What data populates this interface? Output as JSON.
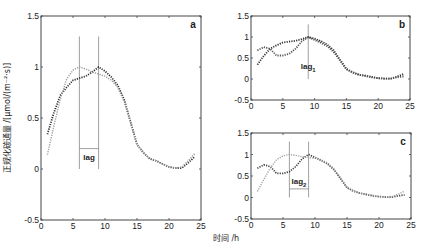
{
  "chart_data": [
    {
      "type": "line",
      "panel": "a",
      "title": "a",
      "xlabel": "时间 /h",
      "ylabel": "正规化碳通量 /[μmol/(m⁻²·s)]",
      "xlim": [
        0,
        25
      ],
      "ylim": [
        -0.5,
        1.5
      ],
      "xticks": [
        "0",
        "5",
        "10",
        "15",
        "20",
        "25"
      ],
      "yticks": [
        "-0.5",
        "0",
        "0.5",
        "1",
        "1.5"
      ],
      "grid": false,
      "x": [
        1,
        2,
        3,
        4,
        5,
        6,
        7,
        8,
        9,
        10,
        11,
        12,
        13,
        14,
        15,
        16,
        17,
        18,
        19,
        20,
        21,
        22,
        23,
        24
      ],
      "series": [
        {
          "name": "dark dotted",
          "style": "dotted",
          "color": "#333333",
          "values": [
            0.34,
            0.55,
            0.72,
            0.8,
            0.87,
            0.89,
            0.91,
            0.95,
            1.0,
            0.96,
            0.9,
            0.82,
            0.68,
            0.46,
            0.24,
            0.16,
            0.1,
            0.08,
            0.05,
            0.02,
            0.01,
            0.01,
            0.06,
            0.12
          ]
        },
        {
          "name": "light dotted",
          "style": "dotted",
          "color": "#9a9a9a",
          "values": [
            0.14,
            0.42,
            0.68,
            0.88,
            0.97,
            1.0,
            0.98,
            0.95,
            0.93,
            0.91,
            0.87,
            0.8,
            0.66,
            0.45,
            0.24,
            0.16,
            0.1,
            0.08,
            0.05,
            0.02,
            0.01,
            0.02,
            0.08,
            0.15
          ]
        }
      ],
      "annotations": [
        {
          "type": "vline",
          "x": 6,
          "y_range": [
            0,
            1.3
          ]
        },
        {
          "type": "vline",
          "x": 9,
          "y_range": [
            0,
            1.3
          ]
        },
        {
          "type": "hline",
          "x_range": [
            6,
            9
          ],
          "y": 0.2
        },
        {
          "type": "text",
          "text": "lag",
          "x": 7.5,
          "y": 0.12
        }
      ]
    },
    {
      "type": "line",
      "panel": "b",
      "title": "b",
      "xlim": [
        0,
        25
      ],
      "ylim": [
        -0.5,
        1.5
      ],
      "xticks": [
        "0",
        "5",
        "10",
        "15",
        "20",
        "25"
      ],
      "yticks": [
        "-0.5",
        "0",
        "0.5",
        "1",
        "1.5"
      ],
      "grid": false,
      "x": [
        1,
        2,
        3,
        4,
        5,
        6,
        7,
        8,
        9,
        10,
        11,
        12,
        13,
        14,
        15,
        16,
        17,
        18,
        19,
        20,
        21,
        22,
        23,
        24
      ],
      "series": [
        {
          "name": "dark dotted",
          "style": "dotted",
          "color": "#333333",
          "values": [
            0.34,
            0.55,
            0.72,
            0.8,
            0.87,
            0.89,
            0.91,
            0.95,
            1.0,
            0.96,
            0.9,
            0.82,
            0.68,
            0.46,
            0.24,
            0.16,
            0.1,
            0.08,
            0.05,
            0.02,
            0.01,
            0.01,
            0.06,
            0.12
          ]
        },
        {
          "name": "second dotted",
          "style": "dotted",
          "color": "#555555",
          "values": [
            0.68,
            0.76,
            0.72,
            0.56,
            0.56,
            0.6,
            0.72,
            0.9,
            1.0,
            0.93,
            0.86,
            0.78,
            0.64,
            0.44,
            0.23,
            0.15,
            0.1,
            0.07,
            0.04,
            0.02,
            0.01,
            0.01,
            0.04,
            0.06
          ]
        }
      ],
      "annotations": [
        {
          "type": "vline",
          "x": 9,
          "y_range": [
            0,
            1.3
          ]
        },
        {
          "type": "text",
          "text": "lag1",
          "x": 9,
          "y": 0.3
        }
      ]
    },
    {
      "type": "line",
      "panel": "c",
      "title": "c",
      "xlim": [
        0,
        25
      ],
      "ylim": [
        -0.5,
        1.5
      ],
      "xticks": [
        "0",
        "5",
        "10",
        "15",
        "20",
        "25"
      ],
      "yticks": [
        "-0.5",
        "0",
        "0.5",
        "1",
        "1.5"
      ],
      "grid": false,
      "x": [
        1,
        2,
        3,
        4,
        5,
        6,
        7,
        8,
        9,
        10,
        11,
        12,
        13,
        14,
        15,
        16,
        17,
        18,
        19,
        20,
        21,
        22,
        23,
        24
      ],
      "series": [
        {
          "name": "dark dotted",
          "style": "dotted",
          "color": "#444444",
          "values": [
            0.68,
            0.76,
            0.72,
            0.56,
            0.56,
            0.6,
            0.72,
            0.9,
            1.0,
            0.93,
            0.86,
            0.78,
            0.64,
            0.44,
            0.23,
            0.15,
            0.1,
            0.07,
            0.04,
            0.02,
            0.01,
            0.01,
            0.04,
            0.06
          ]
        },
        {
          "name": "light dotted",
          "style": "dotted",
          "color": "#a0a0a0",
          "values": [
            0.14,
            0.42,
            0.68,
            0.88,
            0.97,
            1.0,
            0.98,
            0.95,
            0.93,
            0.91,
            0.87,
            0.8,
            0.66,
            0.45,
            0.24,
            0.16,
            0.1,
            0.08,
            0.05,
            0.02,
            0.01,
            0.02,
            0.08,
            0.15
          ]
        }
      ],
      "annotations": [
        {
          "type": "vline",
          "x": 6,
          "y_range": [
            0,
            1.3
          ]
        },
        {
          "type": "vline",
          "x": 9,
          "y_range": [
            0,
            1.3
          ]
        },
        {
          "type": "hline",
          "x_range": [
            6,
            9
          ],
          "y": 0.2
        },
        {
          "type": "text",
          "text": "lag2",
          "x": 7.5,
          "y": 0.38
        }
      ]
    }
  ],
  "labels": {
    "xlabel": "时间 /h",
    "ylabel": "正规化碳通量 /[μmol/(m⁻²·s)]",
    "panel_a": "a",
    "panel_b": "b",
    "panel_c": "c",
    "lag": "lag",
    "lag1_base": "lag",
    "lag1_sub": "1",
    "lag2_base": "lag",
    "lag2_sub": "2"
  }
}
